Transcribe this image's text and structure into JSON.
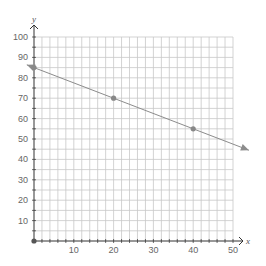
{
  "chart_data": {
    "type": "line",
    "title": "",
    "xlabel": "x",
    "ylabel": "y",
    "xlim": [
      0,
      50
    ],
    "ylim": [
      0,
      100
    ],
    "x_ticks": [
      10,
      20,
      30,
      40,
      50
    ],
    "y_ticks": [
      10,
      20,
      30,
      40,
      50,
      60,
      70,
      80,
      90,
      100
    ],
    "x_grid_step": 2,
    "y_grid_step": 5,
    "grid": true,
    "legend": null,
    "series": [
      {
        "name": "line",
        "points": [
          [
            0,
            85
          ],
          [
            20,
            70
          ],
          [
            40,
            55
          ]
        ],
        "slope": -0.75,
        "intercept": 85,
        "arrows_both_ends": true,
        "color": "#8c8c8c"
      }
    ],
    "origin_point": [
      0,
      0
    ]
  },
  "colors": {
    "grid": "#c8c8c8",
    "axis": "#333333",
    "line": "#8c8c8c",
    "point": "#888888"
  }
}
